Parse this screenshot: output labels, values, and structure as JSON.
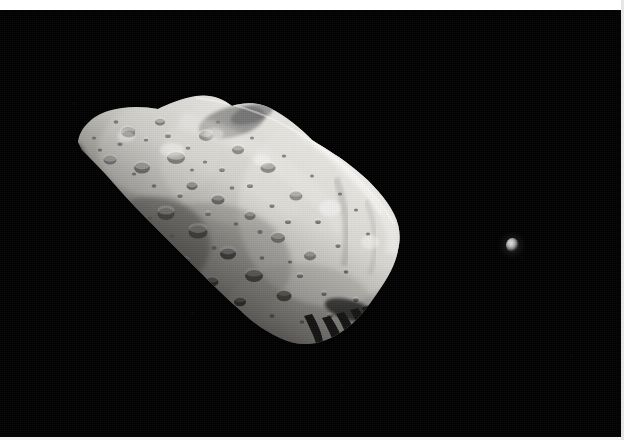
{
  "image": {
    "subject": "asteroid-with-moon",
    "primary_body_name": "asteroid",
    "secondary_body_name": "moon",
    "background_label": "space",
    "frame_style": "white-border-photograph",
    "width_px": 624,
    "height_px": 440
  },
  "colors": {
    "space_black": "#000000",
    "border_white": "#ffffff",
    "border_bottom": "#f2f2f2",
    "border_right": "#e6e6e6",
    "asteroid_highlight": "#e8e7e3",
    "asteroid_midtone": "#a9a8a3",
    "asteroid_shadow": "#3b3b39",
    "asteroid_terminator": "#121212",
    "moon_highlight": "#e2e2e0",
    "moon_shadow": "#131313"
  },
  "primary_body": {
    "bounds": {
      "x": 70,
      "y": 93,
      "width": 336,
      "height": 255
    },
    "long_axis_orientation_deg": 38,
    "illumination_direction": "upper-right",
    "terminator_side": "lower-left",
    "surface_features": "heavily cratered regolith",
    "tip_shadow_streaks": 5
  },
  "secondary_body": {
    "center": {
      "x": 512,
      "y": 245
    },
    "width": 13,
    "height": 15,
    "illumination_direction": "upper-left",
    "relative_brightness": "bright point"
  },
  "frame": {
    "top_band_height": 10,
    "bottom_band_height": 3,
    "right_band_width": 3
  }
}
